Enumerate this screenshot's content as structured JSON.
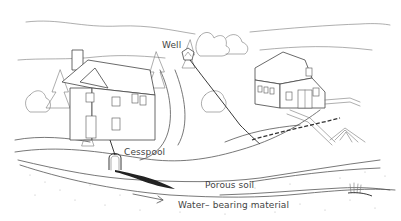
{
  "diagram": {
    "title": "",
    "labels": {
      "well": "Well",
      "cesspool": "Cesspool",
      "porous_soil": "Porous soil",
      "water_bearing_material": "Water– bearing material"
    },
    "elements": [
      {
        "name": "house",
        "description": "Two-story house with chimney, left"
      },
      {
        "name": "barn",
        "description": "Gambrel-roof barn with fenced area, right"
      },
      {
        "name": "well",
        "description": "Small well house on hill, top center"
      },
      {
        "name": "cesspool",
        "description": "Cesspool below house connected by pipe"
      },
      {
        "name": "contamination-plume",
        "description": "Dark plume spreading from cesspool through water-bearing layer"
      },
      {
        "name": "barn-drainage",
        "description": "Dashed drainage line from barn toward the well"
      },
      {
        "name": "manure-pile",
        "description": "Hatched pile near barn"
      },
      {
        "name": "flow-arrow",
        "description": "Arrow indicating groundwater flow direction"
      }
    ],
    "colors": {
      "line": "#555555",
      "background": "#ffffff",
      "plume": "#222222"
    }
  }
}
